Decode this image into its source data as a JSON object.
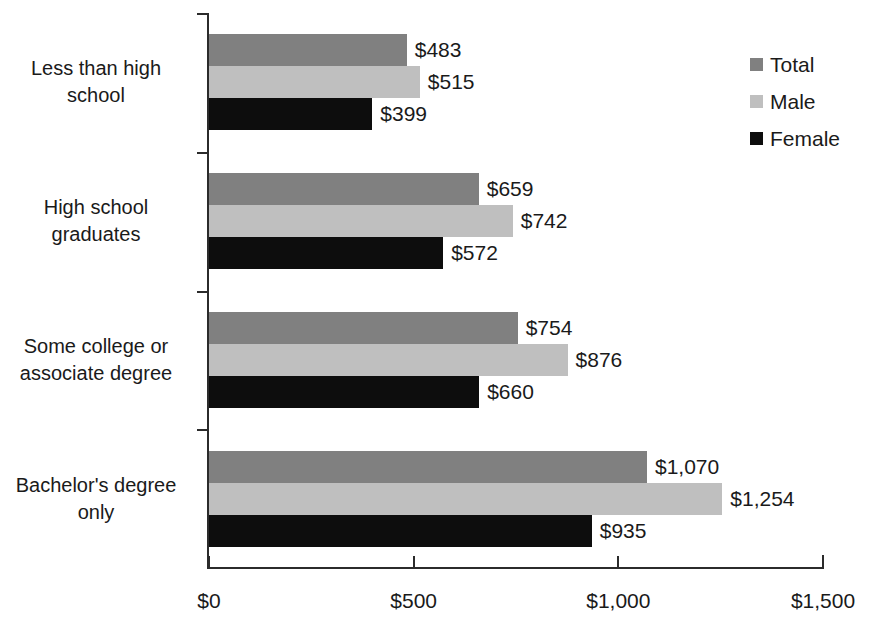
{
  "chart_data": {
    "type": "bar",
    "orientation": "horizontal",
    "title": "",
    "xlabel": "",
    "ylabel": "",
    "xlim": [
      0,
      1500
    ],
    "xticks": [
      0,
      500,
      1000,
      1500
    ],
    "xtick_labels": [
      "$0",
      "$500",
      "$1,000",
      "$1,500"
    ],
    "grid": false,
    "legend_position": "right-top",
    "categories": [
      "Less than high school",
      "High school graduates",
      "Some college or associate degree",
      "Bachelor's degree only"
    ],
    "category_label_lines": [
      [
        "Less than high",
        "school"
      ],
      [
        "High school",
        "graduates"
      ],
      [
        "Some college or",
        "associate degree"
      ],
      [
        "Bachelor's degree",
        "only"
      ]
    ],
    "series": [
      {
        "name": "Total",
        "color": "#808080",
        "values": [
          483,
          659,
          754,
          1070
        ],
        "data_labels": [
          "$483",
          "$659",
          "$754",
          "$1,070"
        ]
      },
      {
        "name": "Male",
        "color": "#bfbfbf",
        "values": [
          515,
          742,
          876,
          1254
        ],
        "data_labels": [
          "$515",
          "$742",
          "$876",
          "$1,254"
        ]
      },
      {
        "name": "Female",
        "color": "#0d0d0d",
        "values": [
          399,
          572,
          660,
          935
        ],
        "data_labels": [
          "$399",
          "$572",
          "$660",
          "$935"
        ]
      }
    ]
  },
  "legend": {
    "items": [
      {
        "label": "Total",
        "color": "#808080"
      },
      {
        "label": "Male",
        "color": "#bfbfbf"
      },
      {
        "label": "Female",
        "color": "#0d0d0d"
      }
    ]
  },
  "axis": {
    "x_tick_labels": [
      "$0",
      "$500",
      "$1,000",
      "$1,500"
    ]
  }
}
